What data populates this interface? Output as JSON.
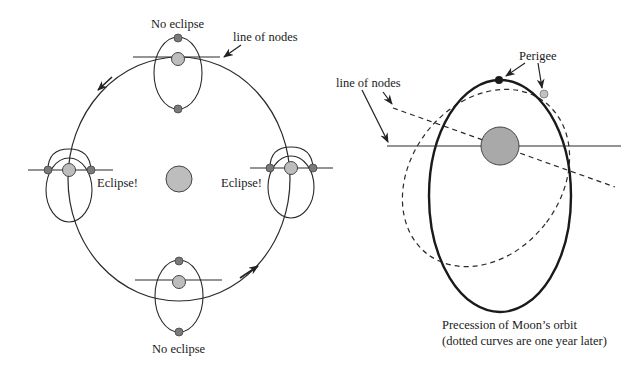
{
  "left_diagram": {
    "labels": {
      "top": "No eclipse",
      "bottom": "No eclipse",
      "left": "Eclipse!",
      "right": "Eclipse!",
      "line_of_nodes": "line of nodes"
    }
  },
  "right_diagram": {
    "labels": {
      "line_of_nodes": "line of nodes",
      "perigee": "Perigee",
      "caption_line1": "Precession of Moon’s orbit",
      "caption_line2": "(dotted curves are one year later)"
    }
  },
  "colors": {
    "stroke": "#2a2a2a",
    "sun_fill": "#bdbdbd",
    "earth_fill": "#bdbdbd",
    "moon_fill": "#7a7a7a",
    "earth_big_fill": "#a9a9a9"
  }
}
